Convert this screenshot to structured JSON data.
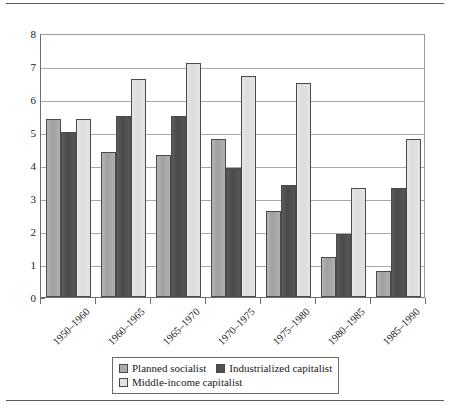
{
  "chart_data": {
    "type": "bar",
    "title": "",
    "subtitle": "",
    "xlabel": "",
    "ylabel": "",
    "categories": [
      "1950–1960",
      "1960–1965",
      "1965–1970",
      "1970–1975",
      "1975–1980",
      "1980–1985",
      "1985–1990"
    ],
    "series": [
      {
        "name": "Planned socialist",
        "color": "#ababab",
        "values": [
          5.4,
          4.4,
          4.3,
          4.8,
          2.6,
          1.2,
          0.8
        ]
      },
      {
        "name": "Industrialized capitalist",
        "color": "#505050",
        "values": [
          5.0,
          5.5,
          5.5,
          3.9,
          3.4,
          1.9,
          3.3
        ]
      },
      {
        "name": "Middle-income capitalist",
        "color": "#e2e2e2",
        "values": [
          5.4,
          6.6,
          7.1,
          6.7,
          6.5,
          3.3,
          4.8
        ]
      }
    ],
    "ylim": [
      0,
      8
    ],
    "yticks": [
      0,
      1,
      2,
      3,
      4,
      5,
      6,
      7,
      8
    ],
    "ytick_labels": [
      "0",
      "1",
      "2",
      "3",
      "4",
      "5",
      "6",
      "7",
      "8"
    ],
    "grid": "horizontal",
    "legend_position": "bottom",
    "xtick_rotation": -45
  },
  "legend": {
    "entries": [
      {
        "label": "Planned socialist",
        "swatch": "s0"
      },
      {
        "label": "Industrialized capitalist",
        "swatch": "s1"
      },
      {
        "label": "Middle-income capitalist",
        "swatch": "s2"
      }
    ]
  }
}
